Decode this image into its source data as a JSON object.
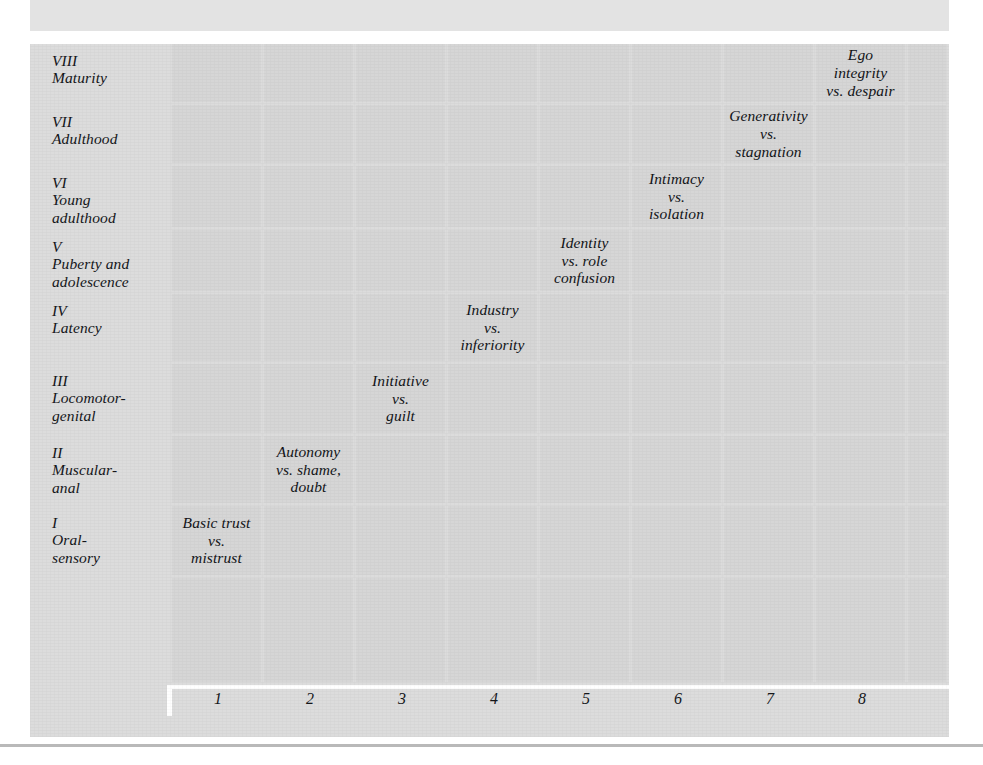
{
  "figure": {
    "type": "matrix-diagram",
    "top_band_label": "",
    "stage_axis_label": "",
    "crisis_axis_label": ""
  },
  "rows": [
    {
      "numeral": "VIII",
      "stage_name": "Maturity"
    },
    {
      "numeral": "VII",
      "stage_name": "Adulthood"
    },
    {
      "numeral": "VI",
      "stage_name": "Young\nadulthood"
    },
    {
      "numeral": "V",
      "stage_name": "Puberty and\nadolescence"
    },
    {
      "numeral": "IV",
      "stage_name": "Latency"
    },
    {
      "numeral": "III",
      "stage_name": "Locomotor-\ngenital"
    },
    {
      "numeral": "II",
      "stage_name": "Muscular-\nanal"
    },
    {
      "numeral": "I",
      "stage_name": "Oral-\nsensory"
    }
  ],
  "columns": [
    "1",
    "2",
    "3",
    "4",
    "5",
    "6",
    "7",
    "8"
  ],
  "cells": [
    {
      "row": 0,
      "col": 7,
      "text": "Ego\nintegrity\nvs. despair"
    },
    {
      "row": 1,
      "col": 6,
      "text": "Generativity\nvs.\nstagnation"
    },
    {
      "row": 2,
      "col": 5,
      "text": "Intimacy\nvs.\nisolation"
    },
    {
      "row": 3,
      "col": 4,
      "text": "Identity\nvs. role\nconfusion"
    },
    {
      "row": 4,
      "col": 3,
      "text": "Industry\nvs.\ninferiority"
    },
    {
      "row": 5,
      "col": 2,
      "text": "Initiative\nvs.\nguilt"
    },
    {
      "row": 6,
      "col": 1,
      "text": "Autonomy\nvs. shame,\ndoubt"
    },
    {
      "row": 7,
      "col": 0,
      "text": "Basic trust\nvs.\nmistrust"
    }
  ],
  "chart_data": {
    "type": "table",
    "title": "",
    "xlabel": "",
    "ylabel": "",
    "categories": [
      "1",
      "2",
      "3",
      "4",
      "5",
      "6",
      "7",
      "8"
    ],
    "row_categories": [
      "VIII Maturity",
      "VII Adulthood",
      "VI Young adulthood",
      "V Puberty and adolescence",
      "IV Latency",
      "III Locomotor-genital",
      "II Muscular-anal",
      "I Oral-sensory"
    ],
    "diagonal_entries": [
      {
        "stage": "I Oral-sensory",
        "crisis_number": 1,
        "crisis": "Basic trust vs. mistrust"
      },
      {
        "stage": "II Muscular-anal",
        "crisis_number": 2,
        "crisis": "Autonomy vs. shame, doubt"
      },
      {
        "stage": "III Locomotor-genital",
        "crisis_number": 3,
        "crisis": "Initiative vs. guilt"
      },
      {
        "stage": "IV Latency",
        "crisis_number": 4,
        "crisis": "Industry vs. inferiority"
      },
      {
        "stage": "V Puberty and adolescence",
        "crisis_number": 5,
        "crisis": "Identity vs. role confusion"
      },
      {
        "stage": "VI Young adulthood",
        "crisis_number": 6,
        "crisis": "Intimacy vs. isolation"
      },
      {
        "stage": "VII Adulthood",
        "crisis_number": 7,
        "crisis": "Generativity vs. stagnation"
      },
      {
        "stage": "VIII Maturity",
        "crisis_number": 8,
        "crisis": "Ego integrity vs. despair"
      }
    ],
    "grid": true,
    "legend": "none"
  },
  "colors": {
    "page_background": "#ffffff",
    "panel_background": "#dcdcdc",
    "cell_fill": "#d6d6d6",
    "gridline": "#ffffff",
    "text": "#14161a",
    "top_band": "#e3e3e3"
  },
  "layout": {
    "row_boundaries_px": [
      0,
      61,
      122,
      186,
      250,
      320,
      392,
      462,
      534,
      638
    ],
    "col_boundaries_px": [
      0,
      92,
      184,
      276,
      368,
      460,
      552,
      644,
      736,
      777
    ]
  }
}
